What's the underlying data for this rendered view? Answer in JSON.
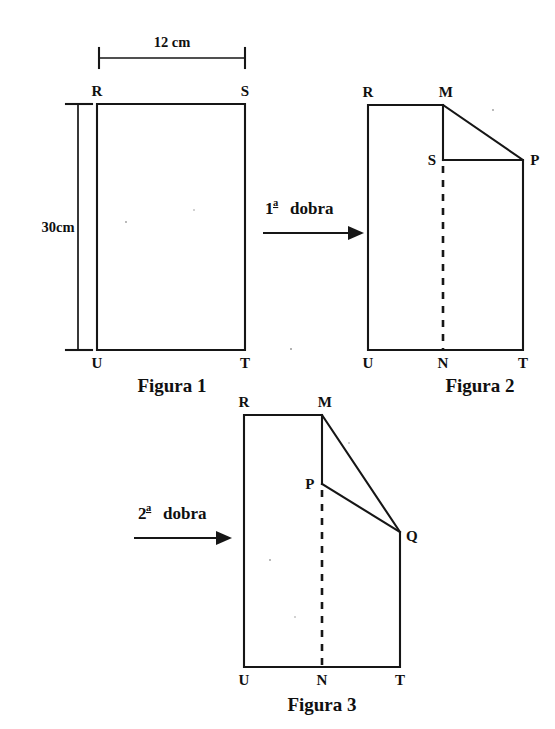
{
  "page": {
    "background_color": "#ffffff",
    "ink_color": "#161616",
    "width": 555,
    "height": 729
  },
  "dimensions": {
    "width_label": "12 cm",
    "height_label": "30cm"
  },
  "steps": {
    "first_fold": {
      "ordinal": "1",
      "ordinal_suffix": "a",
      "text": "dobra"
    },
    "second_fold": {
      "ordinal": "2",
      "ordinal_suffix": "a",
      "text": "dobra"
    }
  },
  "figures": [
    {
      "id": "figure-1",
      "caption": "Figura 1",
      "vertices": [
        {
          "name": "R",
          "label": "R"
        },
        {
          "name": "S",
          "label": "S"
        },
        {
          "name": "U",
          "label": "U"
        },
        {
          "name": "T",
          "label": "T"
        }
      ]
    },
    {
      "id": "figure-2",
      "caption": "Figura 2",
      "vertices": [
        {
          "name": "R",
          "label": "R"
        },
        {
          "name": "M",
          "label": "M"
        },
        {
          "name": "S",
          "label": "S"
        },
        {
          "name": "P",
          "label": "P"
        },
        {
          "name": "U",
          "label": "U"
        },
        {
          "name": "N",
          "label": "N"
        },
        {
          "name": "T",
          "label": "T"
        }
      ]
    },
    {
      "id": "figure-3",
      "caption": "Figura 3",
      "vertices": [
        {
          "name": "R",
          "label": "R"
        },
        {
          "name": "M",
          "label": "M"
        },
        {
          "name": "P",
          "label": "P"
        },
        {
          "name": "Q",
          "label": "Q"
        },
        {
          "name": "U",
          "label": "U"
        },
        {
          "name": "N",
          "label": "N"
        },
        {
          "name": "T",
          "label": "T"
        }
      ]
    }
  ]
}
